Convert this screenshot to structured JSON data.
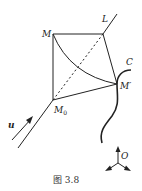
{
  "figure": {
    "caption": "图 3.8",
    "labels": {
      "M": "M",
      "L": "L",
      "C": "C",
      "M_prime": "M′",
      "M0": "M",
      "M0_sub": "0",
      "u": "u",
      "O": "O"
    }
  }
}
